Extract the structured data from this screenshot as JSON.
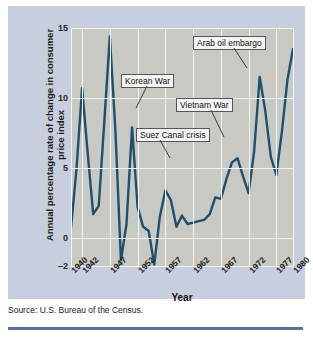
{
  "figure": {
    "source_note": "Source: U.S. Bureau of the Census."
  },
  "chart_data": {
    "type": "line",
    "title": "",
    "xlabel": "Year",
    "ylabel": "Annual percentage rate of change in consumer price index",
    "ylim": [
      -2,
      15
    ],
    "xlim": [
      1940,
      1980
    ],
    "grid": true,
    "legend": "none",
    "yticks": [
      15,
      10,
      5,
      0,
      -2
    ],
    "xticks": [
      "1940",
      "1942",
      "1947",
      "1952",
      "1957",
      "1962",
      "1967",
      "1972",
      "1977",
      "1980"
    ],
    "series": [
      {
        "name": "Annual percentage change in CPI",
        "color": "#1d4f6e",
        "x": [
          1940,
          1941,
          1942,
          1943,
          1944,
          1945,
          1946,
          1947,
          1948,
          1949,
          1950,
          1951,
          1952,
          1953,
          1954,
          1955,
          1956,
          1957,
          1958,
          1959,
          1960,
          1961,
          1962,
          1963,
          1964,
          1965,
          1966,
          1967,
          1968,
          1969,
          1970,
          1971,
          1972,
          1973,
          1974,
          1975,
          1976,
          1977,
          1978,
          1979,
          1980
        ],
        "values": [
          0.7,
          5.0,
          10.7,
          6.1,
          1.7,
          2.3,
          8.3,
          14.4,
          7.7,
          -1.6,
          1.0,
          7.9,
          2.2,
          0.8,
          0.5,
          -1.9,
          1.5,
          3.4,
          2.7,
          0.8,
          1.6,
          1.0,
          1.1,
          1.2,
          1.3,
          1.7,
          2.9,
          2.8,
          4.2,
          5.4,
          5.7,
          4.4,
          3.2,
          6.2,
          11.5,
          9.1,
          5.8,
          4.5,
          7.6,
          11.3,
          13.5
        ]
      }
    ],
    "annotations": [
      {
        "label": "Korean War",
        "point_year": 1951,
        "point_value": 7.9
      },
      {
        "label": "Suez Canal crisis",
        "point_year": 1957,
        "point_value": 3.4
      },
      {
        "label": "Vietnam War",
        "point_year": 1970,
        "point_value": 5.7
      },
      {
        "label": "Arab oil embargo",
        "point_year": 1974,
        "point_value": 11.5
      }
    ]
  }
}
